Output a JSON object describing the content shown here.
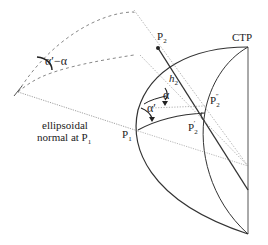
{
  "diagram": {
    "labels": {
      "ctp": "CTP",
      "p2": "P",
      "p2_sub": "2",
      "p2pp": "P",
      "p2pp_sub": "2",
      "p2pp_sup": "″",
      "p2p": "P",
      "p2p_sub": "2",
      "p2p_sup": "′",
      "p1": "P",
      "p1_sub": "1",
      "h2": "h",
      "h2_sub": "2",
      "alpha": "α",
      "alpha_prime": "α′",
      "alpha_diff": "α′−α",
      "normal_line1": "ellipsoidal",
      "normal_line2": "normal at P",
      "normal_sub": "1"
    },
    "colors": {
      "solid": "#333333",
      "dotted": "#888888",
      "dashed": "#777777"
    }
  }
}
